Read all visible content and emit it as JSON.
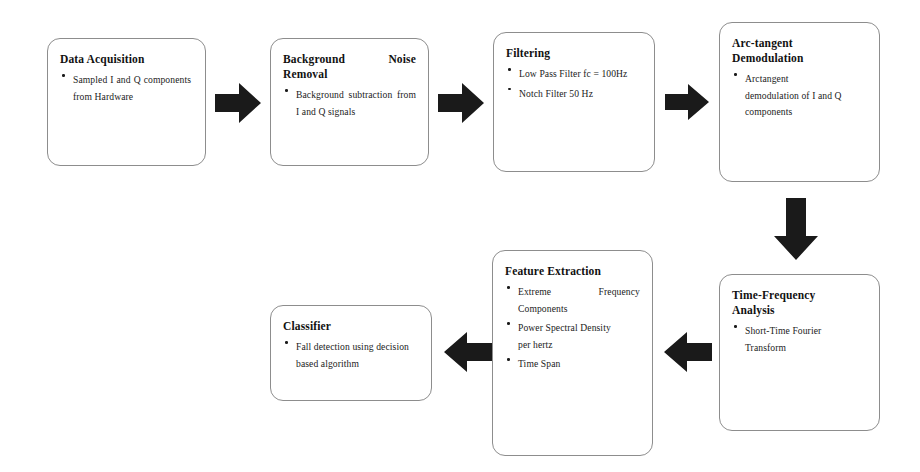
{
  "diagram": {
    "title": "Fall detection signal processing pipeline",
    "box_border_color": "#8d8d8d",
    "arrow_color": "#1a1a1a",
    "background_color": "#ffffff",
    "nodes": [
      {
        "id": "data-acquisition",
        "title": "Data Acquisition",
        "bullets": [
          "Sampled I and Q components from Hardware"
        ]
      },
      {
        "id": "background-noise-removal",
        "title": "Background Noise Removal",
        "title_line1": "Background",
        "title_line2": "Noise",
        "title_line3": "Removal",
        "bullets": [
          "Background subtraction from I and Q signals"
        ]
      },
      {
        "id": "filtering",
        "title": "Filtering",
        "bullets": [
          "Low Pass Filter fc = 100Hz",
          "Notch Filter 50 Hz"
        ]
      },
      {
        "id": "arc-tangent-demodulation",
        "title": "Arc-tangent Demodulation",
        "title_line1": "Arc-tangent",
        "title_line2": "Demodulation",
        "bullets": [
          "Arctangent demodulation of I and Q components"
        ],
        "bullet_line1": "Arctangent",
        "bullet_line2": "demodulation of I and Q",
        "bullet_line3": "components"
      },
      {
        "id": "time-frequency-analysis",
        "title": "Time-Frequency Analysis",
        "title_line1": "Time-Frequency",
        "title_line2": "Analysis",
        "bullets": [
          "Short-Time Fourier Transform"
        ]
      },
      {
        "id": "feature-extraction",
        "title": "Feature Extraction",
        "bullets": [
          "Extreme Frequency Components",
          "Power Spectral Density per hertz",
          "Time Span"
        ],
        "bullet1_line1": "Extreme",
        "bullet1_word2": "Frequency",
        "bullet1_line2": "Components",
        "bullet2_line1": "Power Spectral Density",
        "bullet2_line2": "per hertz",
        "bullet3": "Time Span"
      },
      {
        "id": "classifier",
        "title": "Classifier",
        "bullets": [
          "Fall detection using decision based algorithm"
        ]
      }
    ],
    "arrows": [
      {
        "id": "arrow-acquisition-to-noise",
        "direction": "right",
        "from": "data-acquisition",
        "to": "background-noise-removal"
      },
      {
        "id": "arrow-noise-to-filtering",
        "direction": "right",
        "from": "background-noise-removal",
        "to": "filtering"
      },
      {
        "id": "arrow-filtering-to-demodulation",
        "direction": "right",
        "from": "filtering",
        "to": "arc-tangent-demodulation"
      },
      {
        "id": "arrow-demodulation-to-analysis",
        "direction": "down",
        "from": "arc-tangent-demodulation",
        "to": "time-frequency-analysis"
      },
      {
        "id": "arrow-analysis-to-feature",
        "direction": "left",
        "from": "time-frequency-analysis",
        "to": "feature-extraction"
      },
      {
        "id": "arrow-feature-to-classifier",
        "direction": "left",
        "from": "feature-extraction",
        "to": "classifier"
      }
    ]
  }
}
